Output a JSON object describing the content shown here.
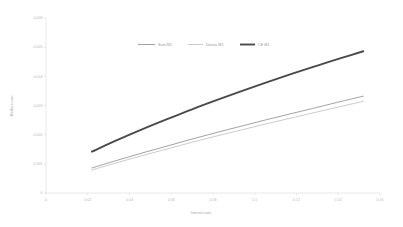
{
  "chart_data": {
    "type": "line",
    "title": "",
    "xlabel": "Interest rate",
    "ylabel": "Welfare cost",
    "xlim": [
      0,
      0.16
    ],
    "ylim": [
      0,
      0.006
    ],
    "grid": false,
    "legend_position": "top-center",
    "xticks": [
      "0",
      "0.02",
      "0.04",
      "0.06",
      "0.08",
      "0.1",
      "0.12",
      "0.14",
      "0.16"
    ],
    "xtick_values": [
      0,
      0.02,
      0.04,
      0.06,
      0.08,
      0.1,
      0.12,
      0.14,
      0.16
    ],
    "yticks": [
      "0",
      "0.001",
      "0.002",
      "0.003",
      "0.004",
      "0.005",
      "0.006"
    ],
    "ytick_values": [
      0,
      0.001,
      0.002,
      0.003,
      0.004,
      0.005,
      0.006
    ],
    "x": [
      0.022,
      0.034,
      0.046,
      0.058,
      0.07,
      0.082,
      0.094,
      0.106,
      0.118,
      0.13,
      0.142,
      0.152
    ],
    "series": [
      {
        "name": "Sum M1",
        "color": "#7a7a7a",
        "width": 0.7,
        "values": [
          0.00086,
          0.00112,
          0.00137,
          0.00161,
          0.00185,
          0.00208,
          0.0023,
          0.00252,
          0.00273,
          0.00294,
          0.00315,
          0.00332
        ]
      },
      {
        "name": "Divisia M1",
        "color": "#b4b4b4",
        "width": 0.7,
        "values": [
          0.00079,
          0.00104,
          0.00128,
          0.00151,
          0.00174,
          0.00196,
          0.00217,
          0.00238,
          0.00258,
          0.00278,
          0.00298,
          0.00314
        ]
      },
      {
        "name": "CE M1",
        "color": "#4a4a4a",
        "width": 1.9,
        "values": [
          0.00142,
          0.00181,
          0.00218,
          0.00253,
          0.00287,
          0.00319,
          0.0035,
          0.0038,
          0.00409,
          0.00437,
          0.00464,
          0.00486
        ]
      }
    ]
  },
  "legend": {
    "entries": [
      {
        "label": "Sum M1"
      },
      {
        "label": "Divisia M1"
      },
      {
        "label": "CE M1"
      }
    ]
  },
  "axes": {
    "x_title": "Interest rate",
    "y_title": "Welfare cost"
  }
}
